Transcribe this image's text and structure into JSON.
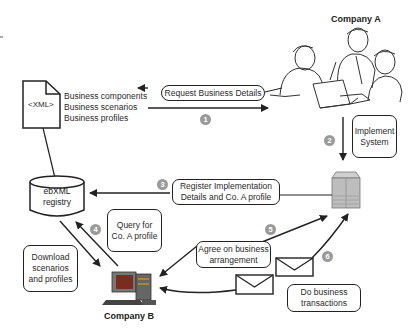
{
  "companies": {
    "a": "Company A",
    "b": "Company B"
  },
  "xml_doc": {
    "label": "<XML>",
    "items": [
      "Business components",
      "Business scenarios",
      "Business profiles"
    ]
  },
  "registry": {
    "line1": "ebXML",
    "line2": "registry"
  },
  "steps": [
    {
      "number": "1",
      "label": "Request Business Details"
    },
    {
      "number": "2",
      "label_lines": [
        "Implement",
        "System"
      ]
    },
    {
      "number": "3",
      "label_lines": [
        "Register Implementation",
        "Details and Co. A profile"
      ]
    },
    {
      "number": "4",
      "label_lines": [
        "Query for",
        "Co. A profile"
      ]
    },
    {
      "number": "5",
      "label_lines": [
        "Agree on business",
        "arrangement"
      ]
    },
    {
      "number": "6",
      "label_lines": [
        "Do business",
        "transactions"
      ]
    }
  ],
  "download_box": {
    "lines": [
      "Download",
      "scenarios",
      "and profiles"
    ]
  },
  "colors": {
    "line": "#222222",
    "badge": "#9a9a9a",
    "server": "#b8b8b8",
    "screen": "#8a3a2a"
  }
}
